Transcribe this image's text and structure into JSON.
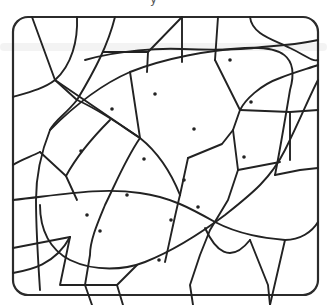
{
  "puzzle": {
    "title_fragment": "y",
    "frame": {
      "x": 13,
      "y": 17,
      "width": 305,
      "height": 278,
      "radius": 15,
      "stroke": "#2b2b2b"
    },
    "line_color": "#222222",
    "background": "#ffffff",
    "edges": [
      "M32 17 L55 80 L77 100",
      "M77 17 C78 40 72 65 55 80 C45 88 30 92 13 97",
      "M115 17 C108 45 95 70 77 100 C65 115 55 120 50 130 C40 155 36 180 36 200 C36 230 38 260 40 290",
      "M55 80 L140 138",
      "M182 17 L148 52 L103 52",
      "M182 17 L182 62",
      "M148 52 L147 72",
      "M218 17 L215 60",
      "M250 17 C252 35 275 40 290 48 C305 55 312 62 318 60",
      "M13 200 C60 195 100 187 140 193 C170 197 190 208 215 222 C240 235 265 238 285 240 C300 240 312 232 318 222",
      "M13 248 L70 237",
      "M13 273 C30 270 55 265 70 237",
      "M70 237 L60 285 L117 285 L123 305",
      "M117 285 L137 265",
      "M13 165 C20 160 30 157 40 152",
      "M40 152 L66 176 L77 200",
      "M66 176 C80 150 100 130 110 120",
      "M77 100 C100 110 120 125 140 138",
      "M85 60 C120 50 160 48 182 49 C210 50 240 50 262 47 C290 45 305 43 318 40",
      "M215 60 L240 110 C245 100 260 85 280 78 C295 72 310 68 318 65",
      "M240 110 L290 112 L318 110",
      "M240 110 L233 130 L222 144 L188 158",
      "M233 130 L238 170",
      "M188 158 L180 195",
      "M140 138 C125 160 115 185 105 205 C98 222 90 240 90 255 L85 285 L92 305",
      "M50 130 C70 110 100 85 130 72 C165 58 210 50 245 48 C280 46 300 55 290 90 C285 120 280 150 275 175",
      "M40 205 C40 230 50 250 70 260 C95 272 125 270 145 262 C175 250 205 230 225 215 C250 195 270 180 285 150 C300 120 310 95 318 80",
      "M275 175 L300 170 L318 168",
      "M290 112 L290 160",
      "M238 170 L280 162",
      "M238 170 L228 200 L210 230 L200 255 L190 285 L193 305",
      "M130 72 L140 138",
      "M140 138 C155 150 170 170 180 195",
      "M180 195 C175 215 170 240 165 262",
      "M250 240 L268 285 L270 305",
      "M205 228 C215 250 230 265 250 240",
      "M285 240 L270 305"
    ],
    "dots": [
      {
        "x": 230,
        "y": 60
      },
      {
        "x": 155,
        "y": 94
      },
      {
        "x": 251,
        "y": 102
      },
      {
        "x": 112,
        "y": 109
      },
      {
        "x": 194,
        "y": 129
      },
      {
        "x": 81,
        "y": 151
      },
      {
        "x": 244,
        "y": 157
      },
      {
        "x": 144,
        "y": 159
      },
      {
        "x": 184,
        "y": 180
      },
      {
        "x": 127,
        "y": 195
      },
      {
        "x": 198,
        "y": 207
      },
      {
        "x": 87,
        "y": 215
      },
      {
        "x": 171,
        "y": 220
      },
      {
        "x": 100,
        "y": 231
      },
      {
        "x": 159,
        "y": 260
      }
    ]
  }
}
